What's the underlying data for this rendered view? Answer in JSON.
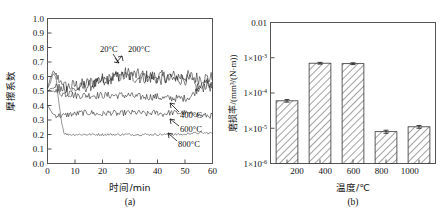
{
  "figure": {
    "panel_a_caption": "(a)",
    "panel_b_caption": "(b)"
  },
  "chart_data": [
    {
      "type": "line",
      "panel": "(a)",
      "title": "",
      "xlabel": "时间/min",
      "ylabel": "摩擦系数",
      "xlim": [
        0,
        60
      ],
      "ylim": [
        0.0,
        1.0
      ],
      "xticks": [
        "0",
        "10",
        "20",
        "30",
        "40",
        "50",
        "60"
      ],
      "yticks": [
        "0.0",
        "0.1",
        "0.2",
        "0.3",
        "0.4",
        "0.5",
        "0.6",
        "0.7",
        "0.8",
        "0.9",
        "1.0"
      ],
      "grid": false,
      "legend": "inline-annotations",
      "annotations": [
        {
          "label": "20°C",
          "x": 26,
          "y": 0.7
        },
        {
          "label": "200°C",
          "x": 35,
          "y": 0.7
        },
        {
          "label": "400°C",
          "x": 55,
          "y": 0.37
        },
        {
          "label": "600°C",
          "x": 55,
          "y": 0.27
        },
        {
          "label": "800°C",
          "x": 55,
          "y": 0.16
        }
      ],
      "series": [
        {
          "name": "20°C",
          "plateau": 0.6,
          "start": 0.5,
          "noise": 0.045,
          "x": [
            0,
            2,
            4,
            6,
            8,
            10,
            12,
            14,
            16,
            18,
            20,
            22,
            24,
            26,
            28,
            30,
            32,
            34,
            36,
            38,
            40,
            42,
            44,
            46,
            48,
            50,
            52,
            54,
            56,
            58,
            60
          ],
          "values": [
            0.5,
            0.52,
            0.52,
            0.53,
            0.53,
            0.54,
            0.54,
            0.55,
            0.56,
            0.57,
            0.58,
            0.59,
            0.6,
            0.61,
            0.62,
            0.62,
            0.61,
            0.61,
            0.6,
            0.6,
            0.6,
            0.6,
            0.6,
            0.6,
            0.6,
            0.6,
            0.6,
            0.59,
            0.59,
            0.59,
            0.59
          ]
        },
        {
          "name": "200°C",
          "plateau": 0.58,
          "start": 0.52,
          "noise": 0.04,
          "x": [
            0,
            2,
            4,
            6,
            8,
            10,
            12,
            14,
            16,
            18,
            20,
            22,
            24,
            26,
            28,
            30,
            32,
            34,
            36,
            38,
            40,
            42,
            44,
            46,
            48,
            50,
            52,
            54,
            56,
            58,
            60
          ],
          "values": [
            0.52,
            0.64,
            0.58,
            0.52,
            0.5,
            0.51,
            0.52,
            0.53,
            0.54,
            0.55,
            0.57,
            0.58,
            0.59,
            0.6,
            0.6,
            0.6,
            0.59,
            0.59,
            0.59,
            0.59,
            0.58,
            0.58,
            0.58,
            0.58,
            0.58,
            0.58,
            0.57,
            0.53,
            0.52,
            0.55,
            0.52
          ]
        },
        {
          "name": "400°C",
          "plateau": 0.46,
          "start": 0.5,
          "noise": 0.025,
          "x": [
            0,
            2,
            4,
            6,
            8,
            10,
            12,
            14,
            16,
            18,
            20,
            22,
            24,
            26,
            28,
            30,
            32,
            34,
            36,
            38,
            40,
            42,
            44,
            46,
            48,
            50,
            52,
            54,
            56,
            58,
            60
          ],
          "values": [
            0.5,
            0.5,
            0.49,
            0.48,
            0.48,
            0.47,
            0.47,
            0.47,
            0.47,
            0.47,
            0.47,
            0.47,
            0.47,
            0.47,
            0.47,
            0.47,
            0.46,
            0.46,
            0.46,
            0.46,
            0.46,
            0.45,
            0.45,
            0.45,
            0.45,
            0.45,
            0.46,
            0.5,
            0.54,
            0.56,
            0.52
          ]
        },
        {
          "name": "600°C",
          "plateau": 0.34,
          "start": 0.4,
          "noise": 0.02,
          "x": [
            0,
            2,
            4,
            6,
            8,
            10,
            12,
            14,
            16,
            18,
            20,
            22,
            24,
            26,
            28,
            30,
            32,
            34,
            36,
            38,
            40,
            42,
            44,
            46,
            48,
            50,
            52,
            54,
            56,
            58,
            60
          ],
          "values": [
            0.4,
            0.34,
            0.33,
            0.33,
            0.34,
            0.34,
            0.35,
            0.35,
            0.35,
            0.34,
            0.34,
            0.35,
            0.35,
            0.34,
            0.35,
            0.35,
            0.35,
            0.35,
            0.34,
            0.35,
            0.35,
            0.34,
            0.35,
            0.35,
            0.35,
            0.35,
            0.34,
            0.34,
            0.33,
            0.33,
            0.33
          ]
        },
        {
          "name": "800°C",
          "plateau": 0.2,
          "start": 0.52,
          "noise": 0.008,
          "x": [
            0,
            1,
            2,
            3,
            4,
            5,
            6,
            7,
            8,
            10,
            12,
            14,
            16,
            18,
            20,
            22,
            24,
            26,
            28,
            30,
            32,
            34,
            36,
            38,
            40,
            42,
            44,
            46,
            48,
            50,
            52,
            54,
            56,
            58,
            60
          ],
          "values": [
            0.52,
            0.55,
            0.62,
            0.6,
            0.45,
            0.3,
            0.21,
            0.2,
            0.2,
            0.2,
            0.2,
            0.2,
            0.2,
            0.2,
            0.2,
            0.2,
            0.2,
            0.2,
            0.2,
            0.2,
            0.2,
            0.2,
            0.2,
            0.2,
            0.2,
            0.2,
            0.2,
            0.2,
            0.2,
            0.2,
            0.21,
            0.21,
            0.21,
            0.21,
            0.21
          ]
        }
      ]
    },
    {
      "type": "bar",
      "panel": "(b)",
      "title": "",
      "xlabel": "温度/℃",
      "ylabel": "磨损率/(mm³/(N·m))",
      "categories": [
        "200",
        "400",
        "600",
        "800",
        "1000"
      ],
      "values": [
        6e-05,
        0.0007,
        0.00068,
        8e-06,
        1.1e-05
      ],
      "errors": [
        5e-06,
        4e-05,
        4e-05,
        8e-07,
        1e-06
      ],
      "yscale": "log",
      "ylim": [
        1e-06,
        0.01
      ],
      "yticks": [
        "0.01",
        "1×10",
        "1×10",
        "1×10",
        "1×10"
      ],
      "ytick_exponents": [
        "",
        "-3",
        "-4",
        "-5",
        "-6"
      ],
      "ytick_values": [
        0.01,
        0.001,
        0.0001,
        1e-05,
        1e-06
      ],
      "grid": false,
      "bar_fill": "#ffffff",
      "bar_hatch": "diagonal",
      "bar_stroke": "#333333"
    }
  ]
}
